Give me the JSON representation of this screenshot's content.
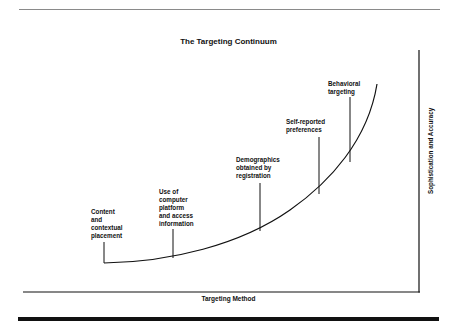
{
  "title": "The Targeting Continuum",
  "axes": {
    "x_label": "Targeting Method",
    "y_label": "Sophistication and Accuracy"
  },
  "stages": [
    {
      "label": "Content\nand\ncontextual\nplacement"
    },
    {
      "label": "Use of\ncomputer\nplatform\nand access\ninformation"
    },
    {
      "label": "Demographics\nobtained by\nregistration"
    },
    {
      "label": "Self-reported\npreferences"
    },
    {
      "label": "Behavioral\ntargeting"
    }
  ],
  "colors": {
    "line": "#111111",
    "top_rule": "#8a8a8a",
    "background": "#ffffff"
  }
}
